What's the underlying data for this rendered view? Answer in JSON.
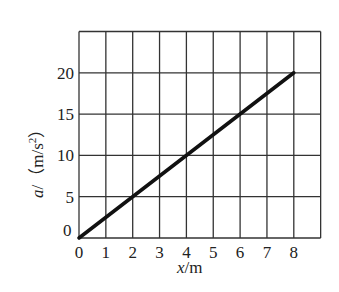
{
  "chart_data": {
    "type": "line",
    "title": "",
    "xlabel": "x/m",
    "ylabel": "a/(m/s²)",
    "x_ticks": [
      "0",
      "1",
      "2",
      "3",
      "4",
      "5",
      "6",
      "7",
      "8"
    ],
    "y_ticks": [
      "0",
      "5",
      "10",
      "15",
      "20"
    ],
    "xlim": [
      0,
      9
    ],
    "ylim": [
      0,
      25
    ],
    "grid": true,
    "legend": null,
    "series": [
      {
        "name": "a vs x",
        "x": [
          0,
          8
        ],
        "y": [
          0,
          20
        ]
      }
    ]
  },
  "labels": {
    "origin_y": "0",
    "xlabel_var": "x",
    "xlabel_unit": "/m",
    "ylabel_var": "a",
    "ylabel_unit_open": "/（m/s",
    "ylabel_sup": "2",
    "ylabel_unit_close": "）"
  }
}
